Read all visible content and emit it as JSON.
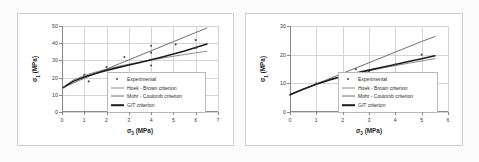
{
  "figure": {
    "background": "#fbfbfb",
    "panel_background": "#ffffff",
    "grid_color": "#d4d4d4",
    "axis_color": "#8a8a8a"
  },
  "series_styles": {
    "experimental": {
      "color": "#4b4b4b",
      "marker": "dot"
    },
    "hoek_brown": {
      "color": "#8d8d8d",
      "width": 1.0
    },
    "mohr_coulomb": {
      "color": "#6f6f6f",
      "width": 1.0
    },
    "git": {
      "color": "#1c1c1c",
      "width": 1.6
    }
  },
  "legend": {
    "entries": [
      {
        "key": "marker",
        "label": "Experimental",
        "color": "#4b4b4b"
      },
      {
        "key": "line",
        "label": "Hoek - Brown criterion",
        "color": "#8d8d8d"
      },
      {
        "key": "line",
        "label": "Mohr - Coulomb criterion",
        "color": "#6f6f6f"
      },
      {
        "key": "line",
        "label": "GIT criterion",
        "color": "#1c1c1c"
      }
    ]
  },
  "chart_data": [
    {
      "id": "left",
      "type": "scatter",
      "title": "",
      "xlabel": "σ₃ (MPa)",
      "ylabel": "σ₁ (MPa)",
      "xlim": [
        0,
        7
      ],
      "ylim": [
        0,
        50
      ],
      "xticks": [
        0,
        1,
        2,
        3,
        4,
        5,
        6,
        7
      ],
      "yticks": [
        0,
        10,
        20,
        30,
        40,
        50
      ],
      "grid": true,
      "legend_position": "lower-right",
      "series": [
        {
          "name": "Experimental",
          "type": "scatter",
          "points": [
            [
              0.1,
              14.4
            ],
            [
              1.0,
              21.7
            ],
            [
              1.2,
              17.8
            ],
            [
              2.0,
              26.2
            ],
            [
              2.8,
              32.0
            ],
            [
              4.0,
              38.5
            ],
            [
              4.0,
              34.5
            ],
            [
              4.0,
              27.0
            ],
            [
              5.1,
              39.3
            ],
            [
              6.0,
              41.8
            ],
            [
              6.0,
              37.2
            ]
          ]
        },
        {
          "name": "Hoek - Brown criterion",
          "type": "line",
          "points": [
            [
              0.05,
              14.2
            ],
            [
              0.5,
              18.6
            ],
            [
              1.0,
              21.2
            ],
            [
              1.5,
              23.2
            ],
            [
              2.0,
              24.9
            ],
            [
              2.5,
              26.4
            ],
            [
              3.0,
              27.8
            ],
            [
              3.5,
              29.0
            ],
            [
              4.0,
              30.2
            ],
            [
              4.5,
              31.3
            ],
            [
              5.0,
              32.4
            ],
            [
              5.5,
              33.4
            ],
            [
              6.0,
              34.4
            ],
            [
              6.5,
              35.3
            ]
          ]
        },
        {
          "name": "Mohr - Coulomb criterion",
          "type": "line",
          "points": [
            [
              0.05,
              14.3
            ],
            [
              1.0,
              19.6
            ],
            [
              2.0,
              25.0
            ],
            [
              3.0,
              30.3
            ],
            [
              4.0,
              35.6
            ],
            [
              5.0,
              40.9
            ],
            [
              6.0,
              46.2
            ],
            [
              6.5,
              48.8
            ]
          ]
        },
        {
          "name": "GIT criterion",
          "type": "line",
          "points": [
            [
              0.05,
              14.2
            ],
            [
              0.5,
              17.8
            ],
            [
              1.0,
              20.4
            ],
            [
              1.5,
              22.4
            ],
            [
              2.0,
              24.2
            ],
            [
              2.5,
              25.8
            ],
            [
              3.0,
              27.3
            ],
            [
              3.5,
              28.8
            ],
            [
              4.0,
              30.4
            ],
            [
              4.5,
              32.0
            ],
            [
              5.0,
              33.7
            ],
            [
              5.5,
              35.5
            ],
            [
              6.0,
              37.5
            ],
            [
              6.5,
              39.6
            ]
          ]
        }
      ]
    },
    {
      "id": "right",
      "type": "scatter",
      "title": "",
      "xlabel": "σ₃ (MPa)",
      "ylabel": "σ₁ (MPa)",
      "xlim": [
        0,
        6
      ],
      "ylim": [
        0,
        30
      ],
      "xticks": [
        0,
        1,
        2,
        3,
        4,
        5,
        6
      ],
      "yticks": [
        0,
        10,
        20,
        30
      ],
      "grid": true,
      "legend_position": "lower-right",
      "series": [
        {
          "name": "Experimental",
          "type": "scatter",
          "points": [
            [
              1.0,
              10.0
            ],
            [
              2.0,
              10.8
            ],
            [
              2.5,
              14.9
            ],
            [
              3.0,
              14.0
            ],
            [
              4.0,
              16.6
            ],
            [
              5.0,
              20.0
            ]
          ]
        },
        {
          "name": "Hoek - Brown criterion",
          "type": "line",
          "points": [
            [
              0.0,
              6.0
            ],
            [
              0.5,
              8.0
            ],
            [
              1.0,
              9.8
            ],
            [
              1.5,
              11.2
            ],
            [
              2.0,
              12.4
            ],
            [
              2.5,
              13.5
            ],
            [
              3.0,
              14.4
            ],
            [
              3.5,
              15.3
            ],
            [
              4.0,
              16.2
            ],
            [
              4.5,
              17.0
            ],
            [
              5.0,
              17.8
            ],
            [
              5.5,
              18.6
            ]
          ]
        },
        {
          "name": "Mohr - Coulomb criterion",
          "type": "line",
          "points": [
            [
              0.0,
              6.1
            ],
            [
              1.0,
              9.8
            ],
            [
              2.0,
              13.5
            ],
            [
              3.0,
              17.2
            ],
            [
              4.0,
              20.9
            ],
            [
              5.0,
              24.6
            ],
            [
              5.5,
              26.3
            ]
          ]
        },
        {
          "name": "GIT criterion",
          "type": "line",
          "points": [
            [
              0.0,
              6.0
            ],
            [
              0.5,
              7.9
            ],
            [
              1.0,
              9.7
            ],
            [
              1.5,
              11.2
            ],
            [
              2.0,
              12.5
            ],
            [
              2.5,
              13.6
            ],
            [
              3.0,
              14.6
            ],
            [
              3.5,
              15.6
            ],
            [
              4.0,
              16.6
            ],
            [
              4.5,
              17.6
            ],
            [
              5.0,
              18.6
            ],
            [
              5.5,
              19.6
            ]
          ]
        }
      ]
    }
  ]
}
